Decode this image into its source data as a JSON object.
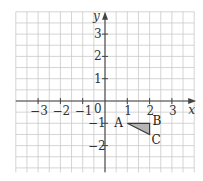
{
  "diagram": {
    "type": "coordinate-grid",
    "axes": {
      "x_label": "x",
      "y_label": "y",
      "origin_label": "0",
      "x_ticks": [
        {
          "value": -3,
          "label": "−3"
        },
        {
          "value": -2,
          "label": "−2"
        },
        {
          "value": -1,
          "label": "−1"
        },
        {
          "value": 1,
          "label": "1"
        },
        {
          "value": 2,
          "label": "2"
        },
        {
          "value": 3,
          "label": "3"
        }
      ],
      "y_ticks": [
        {
          "value": 3,
          "label": "3"
        },
        {
          "value": 2,
          "label": "2"
        },
        {
          "value": 1,
          "label": "1"
        },
        {
          "value": -1,
          "label": "−1"
        },
        {
          "value": -2,
          "label": "−2"
        }
      ],
      "x_range": [
        -4,
        4
      ],
      "y_range": [
        -3.2,
        4
      ],
      "grid_step": 0.5
    },
    "triangle": {
      "fill": "#b5b5b5",
      "vertices": [
        {
          "name": "A",
          "x": 1,
          "y": -1
        },
        {
          "name": "B",
          "x": 2,
          "y": -1
        },
        {
          "name": "C",
          "x": 2,
          "y": -1.5
        }
      ]
    }
  }
}
